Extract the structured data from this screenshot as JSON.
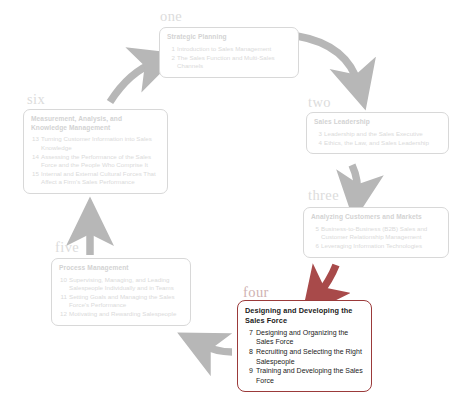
{
  "diagram": {
    "type": "cycle",
    "title_text": "",
    "colors": {
      "faded_text": "#dadada",
      "faded_border": "#d8d8d8",
      "arrow_gray": "#b7b7b7",
      "arrow_red": "#a84a4a",
      "active_border": "#9b3a3a",
      "active_text": "#1b1b1b",
      "number_label": "#dcdcdc",
      "number_label_accent": "#cfb2b2"
    },
    "stages": [
      {
        "key": "one",
        "number_label": "one",
        "title": "Strategic Planning",
        "items": [
          {
            "num": "1",
            "text": "Introduction to Sales Management"
          },
          {
            "num": "2",
            "text": "The Sales Function and Multi-Sales Channels"
          }
        ],
        "active": false
      },
      {
        "key": "two",
        "number_label": "two",
        "title": "Sales Leadership",
        "items": [
          {
            "num": "3",
            "text": "Leadership and the Sales Executive"
          },
          {
            "num": "4",
            "text": "Ethics, the Law, and Sales Leadership"
          }
        ],
        "active": false
      },
      {
        "key": "three",
        "number_label": "three",
        "title": "Analyzing Customers and Markets",
        "items": [
          {
            "num": "5",
            "text": "Business-to-Business (B2B) Sales and Customer Relationship Management"
          },
          {
            "num": "6",
            "text": "Leveraging Information Technologies"
          }
        ],
        "active": false
      },
      {
        "key": "four",
        "number_label": "four",
        "title": "Designing and Developing the Sales Force",
        "items": [
          {
            "num": "7",
            "text": "Designing and Organizing the Sales Force"
          },
          {
            "num": "8",
            "text": "Recruiting and Selecting the Right Salespeople"
          },
          {
            "num": "9",
            "text": "Training and Developing the Sales Force"
          }
        ],
        "active": true
      },
      {
        "key": "five",
        "number_label": "five",
        "title": "Process Management",
        "items": [
          {
            "num": "10",
            "text": "Supervising, Managing, and Leading Salespeople Individually and in Teams"
          },
          {
            "num": "11",
            "text": "Setting Goals and Managing the Sales Force's Performance"
          },
          {
            "num": "12",
            "text": "Motivating and Rewarding Salespeople"
          }
        ],
        "active": false
      },
      {
        "key": "six",
        "number_label": "six",
        "title": "Measurement, Analysis, and Knowledge Management",
        "items": [
          {
            "num": "13",
            "text": "Turning Customer Information into Sales Knowledge"
          },
          {
            "num": "14",
            "text": "Assessing the Performance of the Sales Force and the People Who Comprise It"
          },
          {
            "num": "15",
            "text": "Internal and External Cultural Forces That Affect a Firm's Sales Performance"
          }
        ],
        "active": false
      }
    ],
    "arrows": [
      {
        "from": "one",
        "to": "two",
        "color": "gray"
      },
      {
        "from": "two",
        "to": "three",
        "color": "gray"
      },
      {
        "from": "three",
        "to": "four",
        "color": "red"
      },
      {
        "from": "four",
        "to": "five",
        "color": "gray"
      },
      {
        "from": "five",
        "to": "six",
        "color": "gray"
      },
      {
        "from": "six",
        "to": "one",
        "color": "gray"
      }
    ]
  }
}
